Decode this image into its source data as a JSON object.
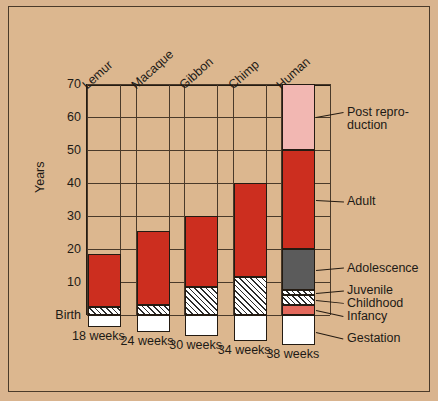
{
  "chart_data": {
    "type": "bar",
    "subtype": "stacked",
    "title": "",
    "xlabel": "",
    "ylabel": "Years",
    "ylim": [
      0,
      70
    ],
    "yticks": [
      70,
      60,
      50,
      40,
      30,
      20,
      10
    ],
    "ytick_labels": [
      "70",
      "60",
      "50",
      "40",
      "30",
      "20",
      "10"
    ],
    "baseline_label": "Birth",
    "grid": true,
    "legend_position": "right",
    "categories": [
      "Lemur",
      "Macaque",
      "Gibbon",
      "Chimp",
      "Human"
    ],
    "gestation_labels": [
      "18 weeks",
      "24 weeks",
      "30 weeks",
      "34 weeks",
      "38 weeks"
    ],
    "stage_order": [
      "Gestation",
      "Infancy",
      "Childhood",
      "Juvenile",
      "Adolescence",
      "Adult",
      "Post reproduction"
    ],
    "series": [
      {
        "name": "Gestation",
        "units": "weeks",
        "values": [
          18,
          24,
          30,
          34,
          38
        ]
      },
      {
        "name": "Infancy",
        "units": "years",
        "values": [
          0,
          0,
          0,
          0,
          3
        ]
      },
      {
        "name": "Childhood",
        "units": "years",
        "values": [
          2.5,
          0,
          0,
          0,
          3
        ]
      },
      {
        "name": "Juvenile",
        "units": "years",
        "values": [
          0,
          2,
          4,
          7,
          1.5
        ]
      },
      {
        "name": "Adolescence",
        "units": "years",
        "values": [
          0,
          0,
          0,
          0,
          4.5
        ]
      },
      {
        "name": "Adult",
        "units": "years",
        "values": [
          13,
          19.5,
          21.5,
          28.5,
          30
        ]
      },
      {
        "name": "Post reproduction",
        "units": "years",
        "values": [
          0,
          0,
          0,
          0,
          20
        ]
      }
    ],
    "bar_tops_years": [
      18.5,
      25.5,
      30,
      40,
      70
    ],
    "bars": [
      {
        "category": "Lemur",
        "gestation_weeks": "18 weeks",
        "top_years": 18.5,
        "segments": [
          {
            "stage": "Gestation",
            "from": -3.5,
            "to": 0
          },
          {
            "stage": "Childhood",
            "from": 0,
            "to": 2.5
          },
          {
            "stage": "Adult",
            "from": 2.5,
            "to": 18.5
          }
        ]
      },
      {
        "category": "Macaque",
        "gestation_weeks": "24 weeks",
        "top_years": 25.5,
        "segments": [
          {
            "stage": "Gestation",
            "from": -5,
            "to": 0
          },
          {
            "stage": "Juvenile",
            "from": 0,
            "to": 3
          },
          {
            "stage": "Adult",
            "from": 3,
            "to": 25.5
          }
        ]
      },
      {
        "category": "Gibbon",
        "gestation_weeks": "30 weeks",
        "top_years": 30,
        "segments": [
          {
            "stage": "Gestation",
            "from": -6.5,
            "to": 0
          },
          {
            "stage": "Juvenile",
            "from": 0,
            "to": 8.5
          },
          {
            "stage": "Adult",
            "from": 8.5,
            "to": 30
          }
        ]
      },
      {
        "category": "Chimp",
        "gestation_weeks": "34 weeks",
        "top_years": 40,
        "segments": [
          {
            "stage": "Gestation",
            "from": -8,
            "to": 0
          },
          {
            "stage": "Juvenile",
            "from": 0,
            "to": 11.5
          },
          {
            "stage": "Adult",
            "from": 11.5,
            "to": 40
          }
        ]
      },
      {
        "category": "Human",
        "gestation_weeks": "38 weeks",
        "top_years": 70,
        "segments": [
          {
            "stage": "Gestation",
            "from": -9,
            "to": 0
          },
          {
            "stage": "Infancy",
            "from": 0,
            "to": 3
          },
          {
            "stage": "Childhood",
            "from": 3,
            "to": 6
          },
          {
            "stage": "Juvenile",
            "from": 6,
            "to": 7.5
          },
          {
            "stage": "Adolescence",
            "from": 7.5,
            "to": 20
          },
          {
            "stage": "Adult",
            "from": 20,
            "to": 50
          },
          {
            "stage": "Post reproduction",
            "from": 50,
            "to": 70
          }
        ]
      }
    ],
    "legend": [
      {
        "label": "Post repro-\nduction",
        "stage": "Post reproduction",
        "color": "#f2b7b2"
      },
      {
        "label": "Adult",
        "stage": "Adult",
        "color": "#cc2e1f"
      },
      {
        "label": "Adolescence",
        "stage": "Adolescence",
        "color": "#5b5b5b"
      },
      {
        "label": "Juvenile",
        "stage": "Juvenile",
        "color": "#ffffff"
      },
      {
        "label": "Childhood",
        "stage": "Childhood",
        "color": "#ffffff"
      },
      {
        "label": "Infancy",
        "stage": "Infancy",
        "color": "#e4695c"
      },
      {
        "label": "Gestation",
        "stage": "Gestation",
        "color": "#ffffff"
      }
    ],
    "colors": {
      "background": "#dcb78f",
      "frame": "#4a3a2a",
      "grid": "#4a3a2a",
      "text": "#1d1a16",
      "adult": "#cc2e1f",
      "post_reproduction": "#f2b7b2",
      "adolescence": "#5b5b5b",
      "infancy": "#e4695c",
      "gestation": "#ffffff"
    }
  }
}
